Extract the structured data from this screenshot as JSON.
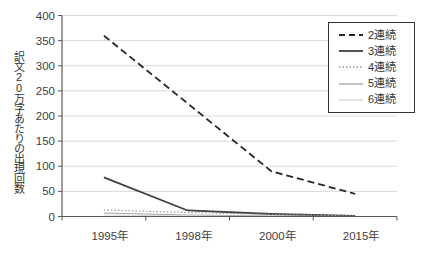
{
  "chart_data": {
    "type": "line",
    "categories": [
      "1995年",
      "1998年",
      "2000年",
      "2015年"
    ],
    "series": [
      {
        "name": "2連続",
        "values": [
          360,
          225,
          90,
          45
        ],
        "color": "#262626",
        "dash": "7 4",
        "width": 1.8
      },
      {
        "name": "3連続",
        "values": [
          78,
          12,
          5,
          1
        ],
        "color": "#404040",
        "dash": "",
        "width": 1.8
      },
      {
        "name": "4連続",
        "values": [
          13,
          8,
          4,
          1
        ],
        "color": "#999999",
        "dash": "1.5 2",
        "width": 1.2
      },
      {
        "name": "5連続",
        "values": [
          7,
          3,
          1,
          0
        ],
        "color": "#a6a6a6",
        "dash": "",
        "width": 1.2
      },
      {
        "name": "6連続",
        "values": [
          3,
          1,
          0,
          0
        ],
        "color": "#d9d9d9",
        "dash": "",
        "width": 1.2
      }
    ],
    "title": "",
    "xlabel": "",
    "ylabel": "訳文20万字あたりの出現回数",
    "ylim": [
      0,
      400
    ],
    "ytick_step": 50,
    "grid": true,
    "legend_position": "top-right",
    "colors": {
      "background": "#ffffff",
      "grid": "#d9d9d9",
      "axis": "#595959",
      "text": "#404040",
      "legend_border": "#333333"
    }
  }
}
